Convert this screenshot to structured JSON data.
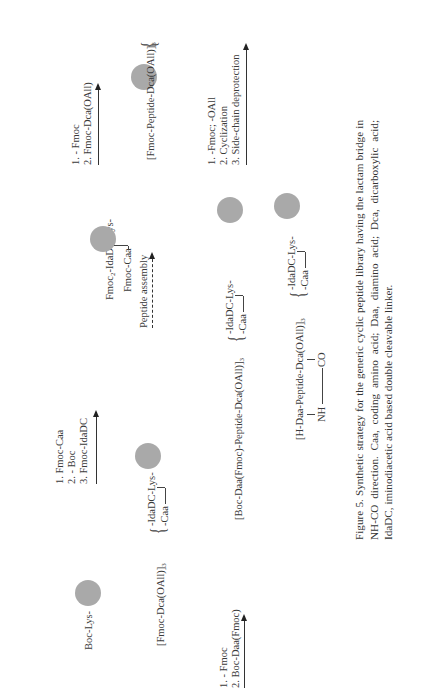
{
  "scheme": {
    "row1": {
      "start": "Boc-Lys-",
      "step1": [
        "1. Fmoc-Caa",
        "2. - Boc",
        "3. Fmoc-IdaDC"
      ],
      "intermediate_top": "Fmoc",
      "intermediate_sub": "2",
      "intermediate_rest": "-IdaDC-Lys-",
      "intermediate_branch": "Fmoc-Caa",
      "step2": [
        "1. - Fmoc",
        "2. Fmoc-Dca(OAll)"
      ]
    },
    "row2": {
      "left_prefix": "[Fmoc-Dca(OAll)]",
      "left_sub": "3",
      "brace_top": "-IdaDC-Lys-",
      "brace_bottom": "-Caa",
      "arrow_label": "Peptide assembly",
      "right_prefix": "[Fmoc-Peptide-Dca(OAll)]",
      "right_sub": "3",
      "right_brace_top": "-IdaDC-Lys-",
      "right_brace_bottom": "-Caa"
    },
    "row3": {
      "step": [
        "1. - Fmoc",
        "2. Boc-Daa(Fmoc)"
      ],
      "product_prefix": "[Boc-Daa(Fmoc)-Peptide-Dca(OAll)]",
      "product_sub": "3",
      "brace_top": "-IdaDC-Lys-",
      "brace_bottom": "-Caa",
      "step2": [
        "1. -Fmoc; -OAll",
        "2. Cyclization",
        "3. Side-chain deprotection"
      ]
    },
    "row4": {
      "product_prefix": "[H-Daa-Peptide-Dca(OAll)]",
      "product_sub": "3",
      "brace_top": "-IdaDC-Lys-",
      "brace_bottom": "-Caa",
      "bridge_left": "NH",
      "bridge_right": "CO"
    }
  },
  "caption": "Figure 5.  Synthetic strategy for the generic cyclic peptide library having the lactam bridge in NH-CO direction. Caa, coding amino acid; Daa, diamino acid; Dca, dicarboxylic acid; IdaDC, iminodiacetic acid based double cleavable linker."
}
